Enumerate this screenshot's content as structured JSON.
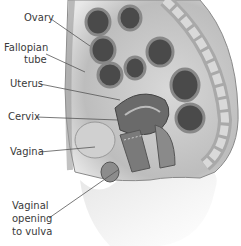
{
  "diagram": {
    "labels": [
      {
        "id": "ovary",
        "text": "Ovary"
      },
      {
        "id": "fallopian-tube",
        "lines": [
          "Fallopian",
          "tube"
        ]
      },
      {
        "id": "uterus",
        "text": "Uterus"
      },
      {
        "id": "cervix",
        "text": "Cervix"
      },
      {
        "id": "vagina",
        "text": "Vagina"
      },
      {
        "id": "vaginal-opening",
        "lines": [
          "Vaginal",
          "opening",
          "to vulva"
        ]
      }
    ]
  }
}
